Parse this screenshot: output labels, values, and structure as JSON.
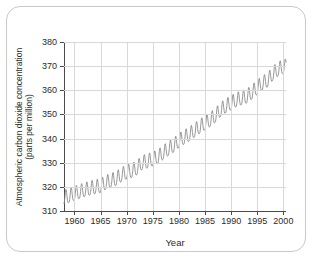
{
  "chart_data": {
    "type": "line",
    "title": "",
    "subtitle": "",
    "xlabel": "Year",
    "ylabel": "Atmospheric carbon dioxide concentration (parts per million)",
    "ylabel_line1": "Atmospheric carbon dioxide concentration",
    "ylabel_line2": "(parts per million)",
    "xlim": [
      1958,
      2000.5
    ],
    "ylim": [
      310,
      380
    ],
    "xticks": [
      1960,
      1965,
      1970,
      1975,
      1980,
      1985,
      1990,
      1995,
      2000
    ],
    "xtick_labels": [
      "1960",
      "1965",
      "1970",
      "1975",
      "1980",
      "1985",
      "1990",
      "1995",
      "2000"
    ],
    "yticks": [
      310,
      320,
      330,
      340,
      350,
      360,
      370,
      380
    ],
    "ytick_labels": [
      "310",
      "320",
      "330",
      "340",
      "350",
      "360",
      "370",
      "380"
    ],
    "grid": true,
    "grid_color": "#d8d8d8",
    "legend": null,
    "line_color": "#8c8c8c",
    "line_width": 0.9,
    "series": [
      {
        "name": "Monthly mean CO2 concentration",
        "description": "Keeling curve: rising annual trend with seasonal sawtooth oscillation",
        "annual_means": [
          {
            "year": 1958,
            "value": 315.2
          },
          {
            "year": 1959,
            "value": 315.9
          },
          {
            "year": 1960,
            "value": 316.9
          },
          {
            "year": 1961,
            "value": 317.6
          },
          {
            "year": 1962,
            "value": 318.4
          },
          {
            "year": 1963,
            "value": 319.0
          },
          {
            "year": 1964,
            "value": 319.6
          },
          {
            "year": 1965,
            "value": 320.0
          },
          {
            "year": 1966,
            "value": 321.4
          },
          {
            "year": 1967,
            "value": 322.2
          },
          {
            "year": 1968,
            "value": 323.0
          },
          {
            "year": 1969,
            "value": 324.6
          },
          {
            "year": 1970,
            "value": 325.7
          },
          {
            "year": 1971,
            "value": 326.3
          },
          {
            "year": 1972,
            "value": 327.5
          },
          {
            "year": 1973,
            "value": 329.7
          },
          {
            "year": 1974,
            "value": 330.2
          },
          {
            "year": 1975,
            "value": 331.1
          },
          {
            "year": 1976,
            "value": 332.0
          },
          {
            "year": 1977,
            "value": 333.8
          },
          {
            "year": 1978,
            "value": 335.4
          },
          {
            "year": 1979,
            "value": 336.8
          },
          {
            "year": 1980,
            "value": 338.7
          },
          {
            "year": 1981,
            "value": 340.1
          },
          {
            "year": 1982,
            "value": 341.4
          },
          {
            "year": 1983,
            "value": 343.0
          },
          {
            "year": 1984,
            "value": 344.6
          },
          {
            "year": 1985,
            "value": 346.0
          },
          {
            "year": 1986,
            "value": 347.4
          },
          {
            "year": 1987,
            "value": 349.2
          },
          {
            "year": 1988,
            "value": 351.6
          },
          {
            "year": 1989,
            "value": 353.1
          },
          {
            "year": 1990,
            "value": 354.4
          },
          {
            "year": 1991,
            "value": 355.6
          },
          {
            "year": 1992,
            "value": 356.4
          },
          {
            "year": 1993,
            "value": 357.1
          },
          {
            "year": 1994,
            "value": 358.8
          },
          {
            "year": 1995,
            "value": 360.8
          },
          {
            "year": 1996,
            "value": 362.6
          },
          {
            "year": 1997,
            "value": 363.8
          },
          {
            "year": 1998,
            "value": 366.6
          },
          {
            "year": 1999,
            "value": 368.3
          },
          {
            "year": 2000,
            "value": 369.5
          }
        ],
        "seasonal_amplitude_ppm": 3.0,
        "seasonal_peak_month": 5,
        "start_value": 315.2,
        "end_value": 369.5
      }
    ]
  }
}
